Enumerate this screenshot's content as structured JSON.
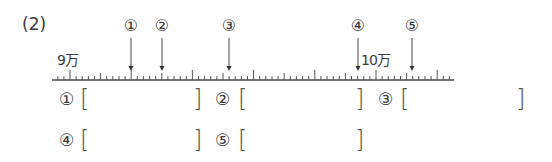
{
  "problem": {
    "number": "(2)"
  },
  "number_line": {
    "start_label": "9万",
    "end_label": "10万",
    "start_value": 90000,
    "end_value": 100000,
    "small_tick_value": 200,
    "medium_tick_every": 5,
    "long_tick_every": 10,
    "x_start": 52,
    "x_end": 454,
    "x_9man": 70,
    "px_per_small_tick": 6.12,
    "y_line": 80,
    "markers": [
      {
        "label": "①",
        "x": 131
      },
      {
        "label": "②",
        "x": 162
      },
      {
        "label": "③",
        "x": 229
      },
      {
        "label": "④",
        "x": 358
      },
      {
        "label": "⑤",
        "x": 412
      }
    ]
  },
  "answers": {
    "row1": [
      {
        "label": "①",
        "open": "[",
        "close": "]",
        "value": ""
      },
      {
        "label": "②",
        "open": "[",
        "close": "]",
        "value": ""
      },
      {
        "label": "③",
        "open": "[",
        "close": "]",
        "value": ""
      }
    ],
    "row2": [
      {
        "label": "④",
        "open": "[",
        "close": "]",
        "value": ""
      },
      {
        "label": "⑤",
        "open": "[",
        "close": "]",
        "value": ""
      }
    ]
  }
}
